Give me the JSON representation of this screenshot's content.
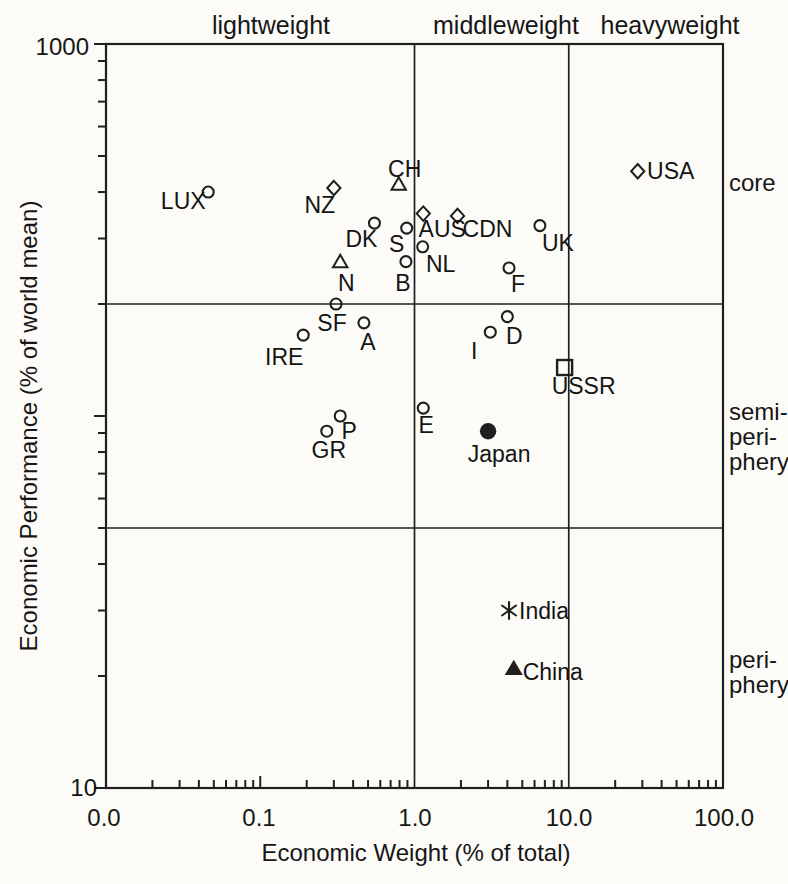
{
  "chart_data": {
    "type": "scatter",
    "title": "",
    "x_axis": {
      "label": "Economic Weight (% of total)",
      "scale": "log",
      "range": [
        0.01,
        100
      ],
      "tick_labels": [
        "0.0",
        "0.1",
        "1.0",
        "10.0",
        "100.0"
      ],
      "tick_values": [
        0.01,
        0.1,
        1,
        10,
        100
      ]
    },
    "y_axis": {
      "label": "Economic Performance (% of world mean)",
      "scale": "log",
      "range": [
        10,
        1000
      ],
      "tick_labels": [
        "1000",
        "10"
      ],
      "tick_values": [
        1000,
        10
      ]
    },
    "grid": "off",
    "zone_boundaries": {
      "x": [
        1,
        10
      ],
      "y": [
        200,
        50
      ]
    },
    "column_labels": [
      "lightweight",
      "middleweight",
      "heavyweight"
    ],
    "row_zone_labels": [
      "core",
      "semi-\nperi-\nphery",
      "peri-\nphery"
    ],
    "marker_legend": {
      "circle": "open circle",
      "diamond": "open diamond",
      "triangle": "open triangle",
      "square": "open square",
      "dot": "filled circle",
      "triangle-filled": "filled triangle",
      "asterisk": "asterisk"
    },
    "ink_color": "#1f1f1f",
    "points": [
      {
        "label": "LUX",
        "x": 0.046,
        "y": 400,
        "marker": "circle",
        "label_dx": -25,
        "label_dy": 9
      },
      {
        "label": "NZ",
        "x": 0.3,
        "y": 410,
        "marker": "diamond",
        "label_dx": -14,
        "label_dy": 17
      },
      {
        "label": "CH",
        "x": 0.79,
        "y": 420,
        "marker": "triangle",
        "label_dx": 6,
        "label_dy": -15
      },
      {
        "label": "DK",
        "x": 0.55,
        "y": 330,
        "marker": "circle",
        "label_dx": -13,
        "label_dy": 16
      },
      {
        "label": "S",
        "x": 0.89,
        "y": 320,
        "marker": "circle",
        "label_dx": -10,
        "label_dy": 16
      },
      {
        "label": "AUS",
        "x": 1.14,
        "y": 350,
        "marker": "diamond",
        "label_dx": 19,
        "label_dy": 15
      },
      {
        "label": "CDN",
        "x": 1.9,
        "y": 345,
        "marker": "diamond",
        "label_dx": 30,
        "label_dy": 13
      },
      {
        "label": "NL",
        "x": 1.13,
        "y": 285,
        "marker": "circle",
        "label_dx": 18,
        "label_dy": 17
      },
      {
        "label": "B",
        "x": 0.88,
        "y": 260,
        "marker": "circle",
        "label_dx": -3,
        "label_dy": 21
      },
      {
        "label": "N",
        "x": 0.33,
        "y": 260,
        "marker": "triangle",
        "label_dx": 6,
        "label_dy": 21
      },
      {
        "label": "UK",
        "x": 6.5,
        "y": 325,
        "marker": "circle",
        "label_dx": 18,
        "label_dy": 17
      },
      {
        "label": "USA",
        "x": 28,
        "y": 455,
        "marker": "diamond",
        "label_dx": 33,
        "label_dy": 0
      },
      {
        "label": "F",
        "x": 4.1,
        "y": 250,
        "marker": "circle",
        "label_dx": 9,
        "label_dy": 16
      },
      {
        "label": "SF",
        "x": 0.31,
        "y": 200,
        "marker": "circle",
        "label_dx": -4,
        "label_dy": 19
      },
      {
        "label": "A",
        "x": 0.47,
        "y": 178,
        "marker": "circle",
        "label_dx": 4,
        "label_dy": 19
      },
      {
        "label": "IRE",
        "x": 0.19,
        "y": 165,
        "marker": "circle",
        "label_dx": -19,
        "label_dy": 22
      },
      {
        "label": "D",
        "x": 4.0,
        "y": 185,
        "marker": "circle",
        "label_dx": 7,
        "label_dy": 19
      },
      {
        "label": "I",
        "x": 3.1,
        "y": 168,
        "marker": "circle",
        "label_dx": -16,
        "label_dy": 19
      },
      {
        "label": "USSR",
        "x": 9.4,
        "y": 135,
        "marker": "square",
        "label_dx": 19,
        "label_dy": 18
      },
      {
        "label": "E",
        "x": 1.14,
        "y": 105,
        "marker": "circle",
        "label_dx": 3,
        "label_dy": 17
      },
      {
        "label": "Japan",
        "x": 3.0,
        "y": 91,
        "marker": "dot",
        "label_dx": 11,
        "label_dy": 23
      },
      {
        "label": "P",
        "x": 0.33,
        "y": 100,
        "marker": "circle",
        "label_dx": 9,
        "label_dy": 15
      },
      {
        "label": "GR",
        "x": 0.27,
        "y": 91,
        "marker": "circle",
        "label_dx": 2,
        "label_dy": 19
      },
      {
        "label": "India",
        "x": 4.1,
        "y": 30,
        "marker": "asterisk",
        "label_dx": 35,
        "label_dy": 0
      },
      {
        "label": "China",
        "x": 4.4,
        "y": 21,
        "marker": "triangle-filled",
        "label_dx": 39,
        "label_dy": 4
      }
    ]
  }
}
